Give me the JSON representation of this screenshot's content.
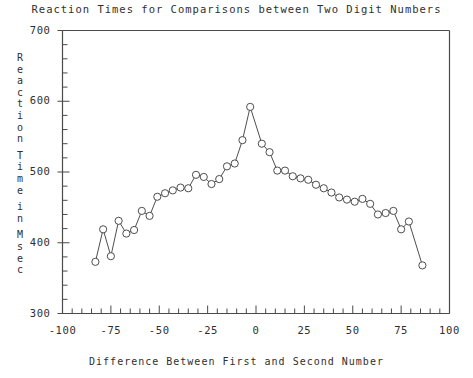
{
  "chart_data": {
    "type": "line",
    "title": "Reaction Times for Comparisons between Two Digit Numbers",
    "xlabel": "Difference Between First and Second Number",
    "ylabel": "Reaction Time in Msec",
    "ylabel_chars": [
      "R",
      "e",
      "a",
      "c",
      "t",
      "i",
      "o",
      "n",
      "",
      "T",
      "i",
      "m",
      "e",
      "",
      "i",
      "n",
      "",
      "M",
      "s",
      "e",
      "c"
    ],
    "xlim": [
      -100,
      100
    ],
    "ylim": [
      300,
      700
    ],
    "xticks": [
      -100,
      -75,
      -50,
      -25,
      0,
      25,
      50,
      75,
      100
    ],
    "xtick_labels": [
      "-100",
      "-75",
      "-50",
      "-25",
      "0",
      "25",
      "50",
      "75",
      "100"
    ],
    "yticks": [
      300,
      400,
      500,
      600,
      700
    ],
    "ytick_labels": [
      "300",
      "400",
      "500",
      "600",
      "700"
    ],
    "x_minor_step": 5,
    "y_minor_step": 20,
    "grid": false,
    "legend": false,
    "marker": "open-circle",
    "line_color": "#3a3a3a",
    "marker_color": "#3a3a3a",
    "axis_color": "#4a4a4a",
    "background": "#ffffff",
    "x": [
      -83,
      -79,
      -75,
      -71,
      -67,
      -63,
      -59,
      -55,
      -51,
      -47,
      -43,
      -39,
      -35,
      -31,
      -27,
      -23,
      -19,
      -15,
      -11,
      -7,
      -3,
      3,
      7,
      11,
      15,
      19,
      23,
      27,
      31,
      35,
      39,
      43,
      47,
      51,
      55,
      59,
      63,
      67,
      71,
      75,
      79,
      86
    ],
    "values": [
      373,
      419,
      381,
      431,
      413,
      418,
      445,
      438,
      465,
      470,
      474,
      478,
      477,
      496,
      493,
      483,
      490,
      508,
      512,
      545,
      592,
      540,
      528,
      502,
      502,
      494,
      491,
      489,
      482,
      477,
      471,
      464,
      461,
      458,
      462,
      455,
      440,
      442,
      445,
      419,
      430,
      368
    ]
  }
}
